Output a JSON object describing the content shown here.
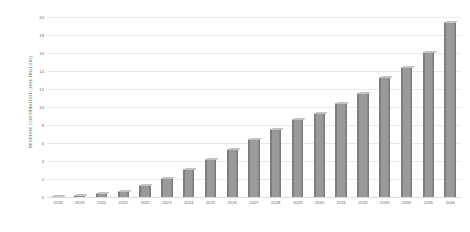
{
  "chart_data": {
    "type": "bar",
    "title": "",
    "subtitle": "",
    "xlabel": "",
    "ylabel": "REVENUE CONTRIBUTION (US$ TRILLION)",
    "categories": [
      "2018",
      "2019",
      "2020",
      "2021",
      "2022",
      "2023",
      "2024",
      "2025",
      "2026",
      "2027",
      "2028",
      "2029",
      "2030",
      "2031",
      "2032",
      "2033",
      "2034",
      "2035",
      "2036"
    ],
    "values": [
      0.1,
      0.2,
      0.4,
      0.7,
      1.3,
      2.1,
      3.1,
      4.2,
      5.3,
      6.4,
      7.6,
      8.7,
      9.3,
      10.4,
      11.6,
      13.3,
      14.4,
      16.1,
      19.4
    ],
    "series": [
      {
        "name": "Revenue contribution",
        "values": [
          0.1,
          0.2,
          0.4,
          0.7,
          1.3,
          2.1,
          3.1,
          4.2,
          5.3,
          6.4,
          7.6,
          8.7,
          9.3,
          10.4,
          11.6,
          13.3,
          14.4,
          16.1,
          19.4
        ]
      }
    ],
    "ylim": [
      0,
      20
    ],
    "yticks": [
      0,
      2,
      4,
      6,
      8,
      10,
      12,
      14,
      16,
      18,
      20
    ],
    "ytick_labels": [
      "0",
      "2",
      "4",
      "6",
      "8",
      "10",
      "12",
      "14",
      "16",
      "18",
      "20"
    ],
    "grid": true,
    "legend": false,
    "legend_position": "none",
    "bar_color": "#9a9a9a",
    "bar_edge_color": "#747474",
    "grid_color": "#e9e9e9",
    "axis_text_color": "#6a6a6a",
    "background_color": "#ffffff",
    "style": "3d-bar"
  }
}
